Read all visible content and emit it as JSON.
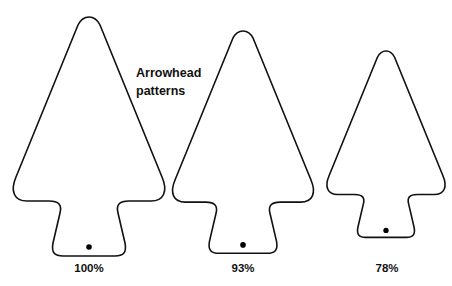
{
  "title": {
    "line1": "Arrowhead",
    "line2": "patterns"
  },
  "patterns": [
    {
      "label": "100%",
      "scale": 1.0
    },
    {
      "label": "93%",
      "scale": 0.93
    },
    {
      "label": "78%",
      "scale": 0.78
    }
  ],
  "colors": {
    "stroke": "#111111",
    "fill": "#ffffff",
    "hole": "#000000"
  }
}
